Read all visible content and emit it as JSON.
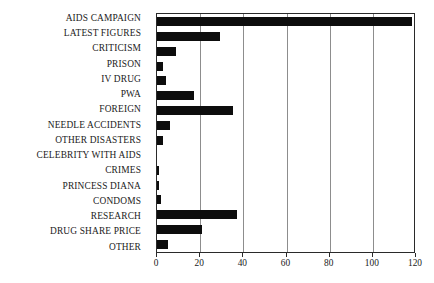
{
  "chart_data": {
    "type": "bar",
    "orientation": "horizontal",
    "title": "",
    "xlabel": "",
    "ylabel": "",
    "xlim": [
      0,
      120
    ],
    "xticks": [
      0,
      20,
      40,
      60,
      80,
      100,
      120
    ],
    "grid": true,
    "legend": false,
    "bar_color": "#0d0d0d",
    "categories": [
      "AIDS CAMPAIGN",
      "LATEST FIGURES",
      "CRITICISM",
      "PRISON",
      "IV DRUG",
      "PWA",
      "FOREIGN",
      "NEEDLE ACCIDENTS",
      "OTHER DISASTERS",
      "CELEBRITY WITH AIDS",
      "CRIMES",
      "PRINCESS DIANA",
      "CONDOMS",
      "RESEARCH",
      "DRUG SHARE PRICE",
      "OTHER"
    ],
    "values": [
      118,
      29,
      9,
      3,
      4,
      17,
      35,
      6,
      3,
      0,
      1,
      1,
      2,
      37,
      21,
      5
    ]
  }
}
